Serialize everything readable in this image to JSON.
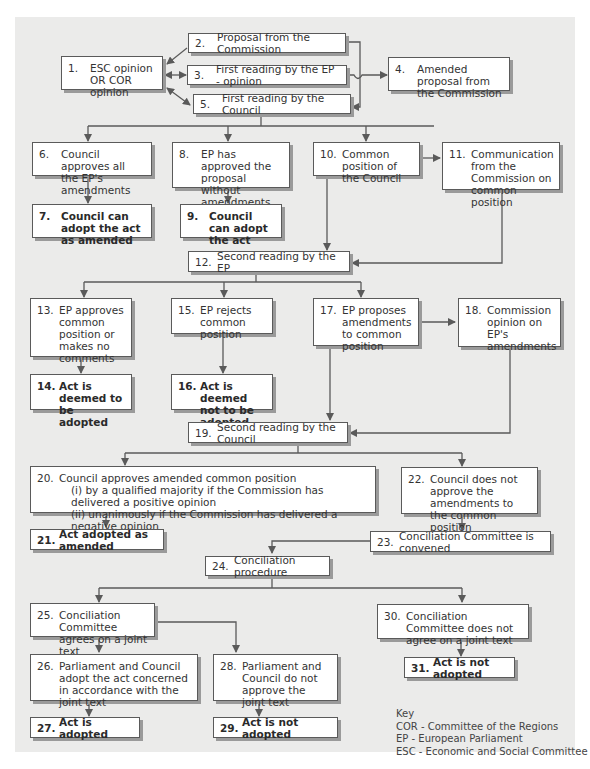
{
  "diagram": {
    "background": "#ebebea",
    "box_border": "#5a5a5a",
    "line_color": "#5a5a5a",
    "nodes": [
      {
        "id": "1",
        "num": "1.",
        "text": "ESC opinion OR COR opinion"
      },
      {
        "id": "2",
        "num": "2.",
        "text": "Proposal from the Commission"
      },
      {
        "id": "3",
        "num": "3.",
        "text": "First reading by the EP - opinion"
      },
      {
        "id": "4",
        "num": "4.",
        "text": "Amended proposal from the Commission"
      },
      {
        "id": "5",
        "num": "5.",
        "text": "First reading by the Council"
      },
      {
        "id": "6",
        "num": "6.",
        "text": "Council approves all the EP's amendments"
      },
      {
        "id": "7",
        "num": "7.",
        "text": "Council can adopt the act as amended",
        "bold": true
      },
      {
        "id": "8",
        "num": "8.",
        "text": "EP has approved the proposal without amendments"
      },
      {
        "id": "9",
        "num": "9.",
        "text": "Council can adopt the act",
        "bold": true
      },
      {
        "id": "10",
        "num": "10.",
        "text": "Common position of the Council"
      },
      {
        "id": "11",
        "num": "11.",
        "text": "Communication from the Commission on common position"
      },
      {
        "id": "12",
        "num": "12.",
        "text": "Second reading by the EP"
      },
      {
        "id": "13",
        "num": "13.",
        "text": "EP approves common position or makes no comments"
      },
      {
        "id": "14",
        "num": "14.",
        "text": "Act is deemed to be adopted",
        "bold": true
      },
      {
        "id": "15",
        "num": "15.",
        "text": "EP rejects common position"
      },
      {
        "id": "16",
        "num": "16.",
        "text": "Act is deemed not to be adopted",
        "bold": true
      },
      {
        "id": "17",
        "num": "17.",
        "text": "EP proposes amendments to common position"
      },
      {
        "id": "18",
        "num": "18.",
        "text": "Commission opinion on EP's amendments"
      },
      {
        "id": "19",
        "num": "19.",
        "text": "Second reading by the Council"
      },
      {
        "id": "20",
        "num": "20.",
        "text": "Council approves amended common position",
        "subitems": [
          "(i)  by a qualified majority if the Commission has delivered a positive opinion",
          "(ii)  unanimously if the Commission has delivered a negative opinion"
        ]
      },
      {
        "id": "21",
        "num": "21.",
        "text": "Act adopted as amended",
        "bold": true
      },
      {
        "id": "22",
        "num": "22.",
        "text": "Council does not approve the amendments to the common position"
      },
      {
        "id": "23",
        "num": "23.",
        "text": "Conciliation Committee is convened"
      },
      {
        "id": "24",
        "num": "24.",
        "text": "Conciliation procedure"
      },
      {
        "id": "25",
        "num": "25.",
        "text": "Conciliation Committee agrees on a joint text"
      },
      {
        "id": "26",
        "num": "26.",
        "text": "Parliament and Council adopt the act concerned in accordance with the joint text"
      },
      {
        "id": "27",
        "num": "27.",
        "text": "Act is adopted",
        "bold": true
      },
      {
        "id": "28",
        "num": "28.",
        "text": "Parliament and Council do not approve the joint text"
      },
      {
        "id": "29",
        "num": "29.",
        "text": "Act is not adopted",
        "bold": true
      },
      {
        "id": "30",
        "num": "30.",
        "text": "Conciliation Committee does not agree on a joint text"
      },
      {
        "id": "31",
        "num": "31.",
        "text": "Act is not adopted",
        "bold": true
      }
    ],
    "edges": [
      [
        "2",
        "1"
      ],
      [
        "1",
        "3"
      ],
      [
        "3",
        "1"
      ],
      [
        "1",
        "5"
      ],
      [
        "5",
        "1"
      ],
      [
        "2",
        "4"
      ],
      [
        "3",
        "4"
      ],
      [
        "4",
        "5"
      ],
      [
        "5",
        "6"
      ],
      [
        "5",
        "8"
      ],
      [
        "5",
        "10"
      ],
      [
        "6",
        "7"
      ],
      [
        "8",
        "9"
      ],
      [
        "10",
        "11"
      ],
      [
        "10",
        "12"
      ],
      [
        "11",
        "12"
      ],
      [
        "12",
        "13"
      ],
      [
        "12",
        "15"
      ],
      [
        "12",
        "17"
      ],
      [
        "13",
        "14"
      ],
      [
        "15",
        "16"
      ],
      [
        "17",
        "18"
      ],
      [
        "17",
        "19"
      ],
      [
        "18",
        "19"
      ],
      [
        "19",
        "20"
      ],
      [
        "19",
        "22"
      ],
      [
        "20",
        "21"
      ],
      [
        "22",
        "23"
      ],
      [
        "23",
        "24"
      ],
      [
        "24",
        "25"
      ],
      [
        "24",
        "30"
      ],
      [
        "25",
        "26"
      ],
      [
        "25",
        "28"
      ],
      [
        "26",
        "27"
      ],
      [
        "28",
        "29"
      ],
      [
        "30",
        "31"
      ]
    ]
  },
  "key": {
    "title": "Key",
    "entries": [
      "COR - Committee of the Regions",
      "EP - European Parliament",
      "ESC - Economic and Social Committee"
    ]
  }
}
